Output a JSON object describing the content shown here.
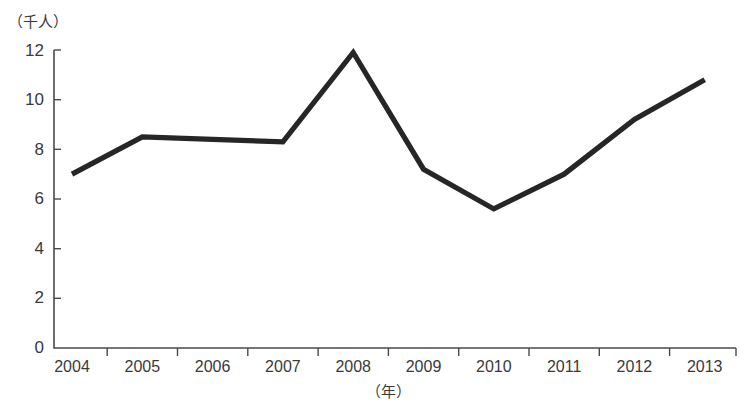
{
  "chart_data": {
    "type": "line",
    "title": "",
    "subtitle": "",
    "xlabel": "（年）",
    "ylabel": "（千人）",
    "categories": [
      "2004",
      "2005",
      "2006",
      "2007",
      "2008",
      "2009",
      "2010",
      "2011",
      "2012",
      "2013"
    ],
    "values": [
      7.0,
      8.5,
      8.4,
      8.3,
      11.9,
      7.2,
      5.6,
      7.0,
      9.2,
      10.8
    ],
    "series": [
      {
        "name": "",
        "values": [
          7.0,
          8.5,
          8.4,
          8.3,
          11.9,
          7.2,
          5.6,
          7.0,
          9.2,
          10.8
        ]
      }
    ],
    "ylim": [
      0,
      12
    ],
    "y_ticks": [
      "0",
      "2",
      "4",
      "6",
      "8",
      "10",
      "12"
    ],
    "y_tick_values": [
      0,
      2,
      4,
      6,
      8,
      10,
      12
    ],
    "grid": false,
    "legend": "none",
    "line_color": "#262626",
    "axis_color": "#4a4a4a",
    "background_color": "#ffffff"
  },
  "axes": {
    "y_unit_label": "（千人）",
    "x_unit_label": "（年）"
  }
}
